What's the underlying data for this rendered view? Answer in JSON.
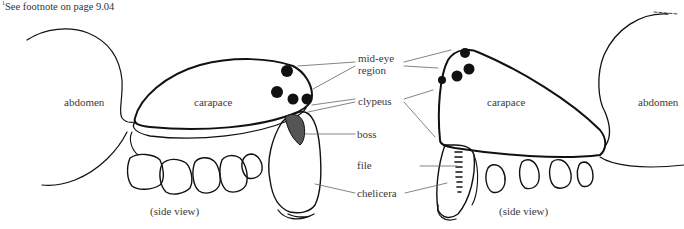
{
  "footnote": {
    "marker": "1",
    "text": "See footnote on page 9.04"
  },
  "left_figure": {
    "labels": {
      "abdomen": "abdomen",
      "carapace": "carapace",
      "view": "(side view)"
    }
  },
  "right_figure": {
    "labels": {
      "abdomen": "abdomen",
      "carapace": "carapace",
      "view": "(side view)"
    }
  },
  "callouts": {
    "mid_eye_region_line1": "mid-eye",
    "mid_eye_region_line2": "region",
    "clypeus": "clypeus",
    "boss": "boss",
    "file": "file",
    "chelicera": "chelicera"
  },
  "colors": {
    "ink": "#111111",
    "leader": "#666666",
    "text": "#3a3a3a",
    "background": "#ffffff"
  }
}
